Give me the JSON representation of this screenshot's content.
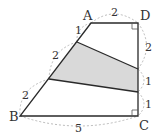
{
  "diagram": {
    "type": "geometry-trapezoid",
    "vertices": {
      "A": {
        "label": "A",
        "x": 91,
        "y": 23
      },
      "B": {
        "label": "B",
        "x": 20,
        "y": 116
      },
      "C": {
        "label": "C",
        "x": 138,
        "y": 116
      },
      "D": {
        "label": "D",
        "x": 138,
        "y": 23
      }
    },
    "division_points": {
      "P1": {
        "x": 77,
        "y": 42
      },
      "P2": {
        "x": 49,
        "y": 79
      },
      "Q1": {
        "x": 138,
        "y": 69
      },
      "Q2": {
        "x": 138,
        "y": 92
      }
    },
    "segment_labels": {
      "AD": "2",
      "A_P1": "1",
      "P1_P2": "2",
      "P2_B": "2",
      "D_Q1": "2",
      "Q1_Q2": "1",
      "Q2_C": "1",
      "BC": "5"
    },
    "right_angles": [
      "D",
      "C"
    ],
    "shaded_region": "P1-Q1-Q2-P2",
    "colors": {
      "stroke": "#2a2a2a",
      "shade": "#d9d9d9",
      "dashed": "#aaaaaa",
      "text": "#333333"
    }
  }
}
